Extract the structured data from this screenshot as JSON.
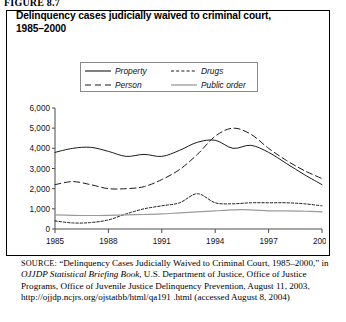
{
  "figure": {
    "label": "FIGURE 8.7"
  },
  "chart_title": {
    "line1": "Delinquency cases judicially waived to criminal court,",
    "line2": "1985–2000"
  },
  "legend": {
    "entries": [
      {
        "label": "Property",
        "style": "solid-dark",
        "color": "#1a1a1a"
      },
      {
        "label": "Person",
        "style": "dashed-dark",
        "color": "#1a1a1a"
      },
      {
        "label": "Drugs",
        "style": "dotted-dark",
        "color": "#1a1a1a"
      },
      {
        "label": "Public order",
        "style": "solid-gray",
        "color": "#9a9a9a"
      }
    ]
  },
  "axes": {
    "y_ticks": [
      "6,000",
      "5,000",
      "4,000",
      "3,000",
      "2,000",
      "1,000",
      "0"
    ],
    "y_min": 0,
    "y_max": 6000,
    "x_ticks": [
      "1985",
      "1988",
      "1991",
      "1994",
      "1997",
      "2000"
    ],
    "x_min": 1985,
    "x_max": 2000
  },
  "source": {
    "kicker": "SOURCE:",
    "text_part1": " “Delinquency Cases Judicially Waived to Criminal Court, 1985–2000,” in ",
    "italic_title": "OJJDP Statistical Briefing Book,",
    "text_part2": " U.S. Department of Justice, Office of Justice Programs, Office of Juvenile Justice Delinquency Prevention, August 11, 2003, http://ojjdp.ncjrs.org/ojstatbb/html/qa191 .html (accessed August 8, 2004)"
  },
  "chart_data": {
    "type": "line",
    "title": "Delinquency cases judicially waived to criminal court, 1985–2000",
    "xlabel": "",
    "ylabel": "",
    "xlim": [
      1985,
      2000
    ],
    "ylim": [
      0,
      6000
    ],
    "grid": false,
    "legend_position": "top-center",
    "x": [
      1985,
      1986,
      1987,
      1988,
      1989,
      1990,
      1991,
      1992,
      1993,
      1994,
      1995,
      1996,
      1997,
      1998,
      1999,
      2000
    ],
    "series": [
      {
        "name": "Property",
        "style": "solid-dark",
        "color": "#1a1a1a",
        "values": [
          3800,
          4000,
          4050,
          3850,
          3600,
          3700,
          3600,
          3900,
          4300,
          4400,
          4000,
          4150,
          3800,
          3250,
          2700,
          2200
        ]
      },
      {
        "name": "Person",
        "style": "dashed-dark",
        "color": "#1a1a1a",
        "values": [
          2200,
          2350,
          2200,
          2000,
          2000,
          2100,
          2450,
          2950,
          3700,
          4600,
          5000,
          4700,
          4000,
          3400,
          2900,
          2500
        ]
      },
      {
        "name": "Drugs",
        "style": "dotted-dark",
        "color": "#1a1a1a",
        "values": [
          400,
          300,
          320,
          450,
          750,
          1000,
          1150,
          1300,
          1750,
          1300,
          1250,
          1300,
          1300,
          1300,
          1250,
          1150
        ]
      },
      {
        "name": "Public order",
        "style": "solid-gray",
        "color": "#9a9a9a",
        "values": [
          700,
          680,
          670,
          680,
          700,
          720,
          750,
          800,
          850,
          900,
          950,
          950,
          900,
          900,
          880,
          850
        ]
      }
    ]
  }
}
